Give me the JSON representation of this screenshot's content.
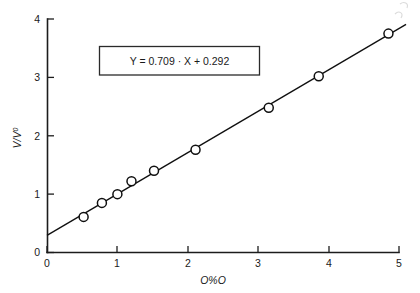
{
  "chart_data": {
    "type": "scatter",
    "title": "",
    "subtitle": "",
    "xlabel": "O%O",
    "ylabel": "V/V⁰",
    "ylabel_base": "V/V",
    "ylabel_sup": "0",
    "xlim": [
      0,
      5
    ],
    "ylim": [
      0,
      4
    ],
    "xticks": [
      0,
      1,
      2,
      3,
      4,
      5
    ],
    "xtick_labels": [
      "0",
      "1",
      "2",
      "3",
      "4",
      "5"
    ],
    "yticks": [
      0,
      1,
      2,
      3,
      4
    ],
    "ytick_labels": [
      "0",
      "1",
      "2",
      "3",
      "4"
    ],
    "grid": false,
    "legend": false,
    "marker_style": "open-circle",
    "points": [
      {
        "x": 0.52,
        "y": 0.61
      },
      {
        "x": 0.78,
        "y": 0.85
      },
      {
        "x": 1.0,
        "y": 1.0
      },
      {
        "x": 1.2,
        "y": 1.22
      },
      {
        "x": 1.52,
        "y": 1.4
      },
      {
        "x": 2.11,
        "y": 1.76
      },
      {
        "x": 3.15,
        "y": 2.48
      },
      {
        "x": 3.86,
        "y": 3.02
      },
      {
        "x": 4.85,
        "y": 3.75
      }
    ],
    "x": [
      0.52,
      0.78,
      1.0,
      1.2,
      1.52,
      2.11,
      3.15,
      3.86,
      4.85
    ],
    "values": [
      0.61,
      0.85,
      1.0,
      1.22,
      1.4,
      1.76,
      2.48,
      3.02,
      3.75
    ],
    "fit": {
      "slope": 0.709,
      "intercept": 0.292,
      "x_start": 0.0,
      "x_end": 5.0,
      "label": "Y = 0.709 · X + 0.292"
    },
    "annotations": [
      {
        "name": "regression-equation",
        "text": "Y = 0.709 · X + 0.292"
      }
    ],
    "colors": {
      "axis": "#1c1c1c",
      "line": "#101010",
      "marker_face": "#ffffff",
      "marker_edge": "#101010",
      "background": "#ffffff",
      "box_border": "#2a2a2a"
    }
  },
  "equation_box": {
    "text": "Y = 0.709 · X + 0.292"
  },
  "axes": {
    "x_title": "O%O",
    "y_title_base": "V/V",
    "y_title_sup": "0",
    "x_tick_labels": [
      "0",
      "1",
      "2",
      "3",
      "4",
      "5"
    ],
    "y_tick_labels": [
      "0",
      "1",
      "2",
      "3",
      "4"
    ]
  }
}
